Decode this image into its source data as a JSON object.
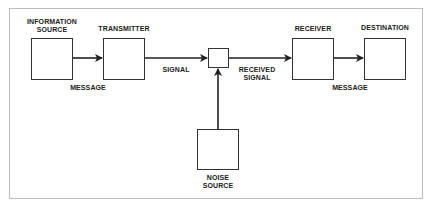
{
  "diagram": {
    "type": "communication-system-block-diagram",
    "nodes": {
      "information_source": {
        "label_line1": "INFORMATION",
        "label_line2": "SOURCE"
      },
      "transmitter": {
        "label": "TRANSMITTER"
      },
      "mixer": {
        "label": ""
      },
      "receiver": {
        "label": "RECEIVER"
      },
      "destination": {
        "label": "DESTINATION"
      },
      "noise_source": {
        "label_line1": "NOISE",
        "label_line2": "SOURCE"
      }
    },
    "edges": {
      "source_to_transmitter": {
        "label": "MESSAGE"
      },
      "transmitter_to_mixer": {
        "label": "SIGNAL"
      },
      "mixer_to_receiver": {
        "label_line1": "RECEIVED",
        "label_line2": "SIGNAL"
      },
      "receiver_to_destination": {
        "label": "MESSAGE"
      },
      "noise_to_mixer": {
        "label": ""
      }
    },
    "colors": {
      "line": "#222222",
      "frame": "#bdbdbd"
    }
  }
}
